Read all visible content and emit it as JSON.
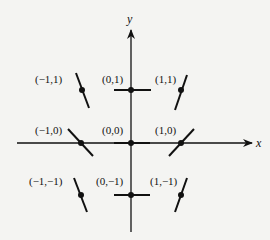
{
  "diagram": {
    "axes": {
      "x_label": "x",
      "y_label": "y"
    },
    "points": [
      {
        "label": "(−1,1)",
        "x": -1,
        "y": 1,
        "slope": "-3"
      },
      {
        "label": "(0,1)",
        "x": 0,
        "y": 1,
        "slope": "0"
      },
      {
        "label": "(1,1)",
        "x": 1,
        "y": 1,
        "slope": "3"
      },
      {
        "label": "(−1,0)",
        "x": -1,
        "y": 0,
        "slope": "-1"
      },
      {
        "label": "(0,0)",
        "x": 0,
        "y": 0,
        "slope": "0"
      },
      {
        "label": "(1,0)",
        "x": 1,
        "y": 0,
        "slope": "1"
      },
      {
        "label": "(−1,−1)",
        "x": -1,
        "y": -1,
        "slope": "-3"
      },
      {
        "label": "(0,−1)",
        "x": 0,
        "y": -1,
        "slope": "0"
      },
      {
        "label": "(1,−1)",
        "x": 1,
        "y": -1,
        "slope": "3"
      }
    ],
    "colors": {
      "line": "#111111",
      "background": "#f4f4f2"
    }
  }
}
